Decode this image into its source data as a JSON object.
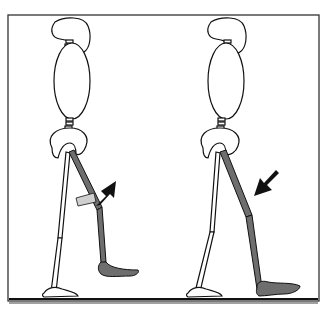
{
  "figure": {
    "colors": {
      "outline": "#111111",
      "bone_fill": "#ffffff",
      "highlight_leg": "#6e6e6e",
      "arrow": "#111111",
      "frame": "#333333"
    },
    "panels": [
      {
        "name": "left-figure",
        "arrow_direction": "up-right"
      },
      {
        "name": "right-figure",
        "arrow_direction": "down-left"
      }
    ]
  }
}
